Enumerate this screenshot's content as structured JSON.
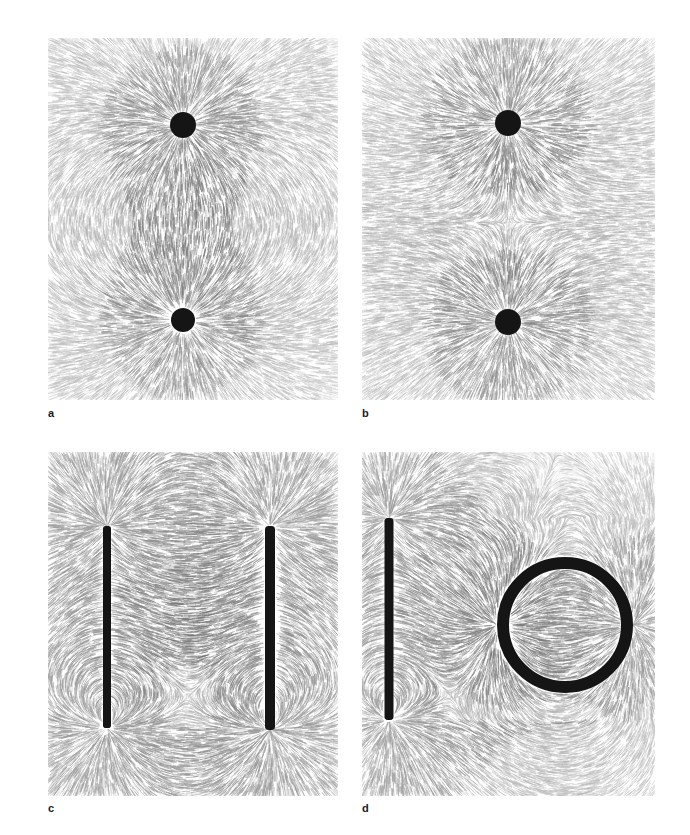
{
  "figure": {
    "kind": "photograph-composite",
    "background_color": "#ffffff",
    "panel_count": 4,
    "medium_description": "iron filings magnetic field line patterns on white paper",
    "filing_color": "#8d8d8d",
    "magnet_color": "#151515"
  },
  "panels": [
    {
      "id": "a",
      "label": "a",
      "x": 48,
      "y": 38,
      "width": 290,
      "height": 362,
      "configuration": "two unlike poles attracting",
      "pattern": "attraction",
      "sources": [
        {
          "name": "pole-dot-upper",
          "shape": "disc",
          "cx": 135,
          "cy": 87,
          "r": 13,
          "polarity": 1
        },
        {
          "name": "pole-dot-lower",
          "shape": "disc",
          "cx": 135,
          "cy": 282,
          "r": 12,
          "polarity": -1
        }
      ]
    },
    {
      "id": "b",
      "label": "b",
      "x": 362,
      "y": 38,
      "width": 293,
      "height": 362,
      "configuration": "two like poles repelling",
      "pattern": "repulsion",
      "neutral_point": {
        "cx": 146,
        "cy": 185
      },
      "sources": [
        {
          "name": "pole-dot-upper",
          "shape": "disc",
          "cx": 146,
          "cy": 85,
          "r": 13,
          "polarity": 1
        },
        {
          "name": "pole-dot-lower",
          "shape": "disc",
          "cx": 146,
          "cy": 284,
          "r": 13,
          "polarity": 1
        }
      ]
    },
    {
      "id": "c",
      "label": "c",
      "x": 48,
      "y": 452,
      "width": 290,
      "height": 344,
      "configuration": "two parallel bar magnets",
      "pattern": "two-bars",
      "sources": [
        {
          "name": "bar-magnet-left",
          "shape": "bar",
          "cx": 59,
          "cy": 175,
          "half_length": 101,
          "thickness": 8,
          "polarity": 1
        },
        {
          "name": "bar-magnet-right",
          "shape": "bar",
          "cx": 222,
          "cy": 176,
          "half_length": 102,
          "thickness": 10,
          "polarity": -1
        }
      ]
    },
    {
      "id": "d",
      "label": "d",
      "x": 362,
      "y": 452,
      "width": 293,
      "height": 344,
      "configuration": "bar magnet beside a ring magnet",
      "pattern": "bar-and-ring",
      "sources": [
        {
          "name": "bar-magnet-left",
          "shape": "bar",
          "cx": 27,
          "cy": 167,
          "half_length": 101,
          "thickness": 9,
          "polarity": 1
        },
        {
          "name": "ring-magnet",
          "shape": "ring",
          "cx": 203,
          "cy": 173,
          "outer_r": 68,
          "stroke": 12,
          "polarity": -1
        }
      ]
    }
  ],
  "labels": {
    "a": "a",
    "b": "b",
    "c": "c",
    "d": "d"
  }
}
